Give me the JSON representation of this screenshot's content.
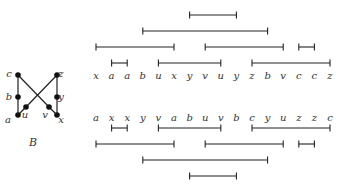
{
  "graph": {
    "caption": "B",
    "nodes": [
      {
        "id": "c",
        "x": 18,
        "y": 75,
        "lx": 9,
        "ly": 77
      },
      {
        "id": "b",
        "x": 18,
        "y": 97,
        "lx": 9,
        "ly": 100
      },
      {
        "id": "a",
        "x": 18,
        "y": 115,
        "lx": 8,
        "ly": 123
      },
      {
        "id": "u",
        "x": 26,
        "y": 107,
        "lx": 25,
        "ly": 118
      },
      {
        "id": "v",
        "x": 49,
        "y": 107,
        "lx": 45,
        "ly": 118
      },
      {
        "id": "z",
        "x": 57,
        "y": 75,
        "lx": 61,
        "ly": 77
      },
      {
        "id": "y",
        "x": 57,
        "y": 97,
        "lx": 61,
        "ly": 100
      },
      {
        "id": "x",
        "x": 57,
        "y": 115,
        "lx": 61,
        "ly": 123
      }
    ],
    "edges": [
      [
        "c",
        "b"
      ],
      [
        "b",
        "a"
      ],
      [
        "z",
        "y"
      ],
      [
        "y",
        "x"
      ],
      [
        "c",
        "v"
      ],
      [
        "v",
        "x"
      ],
      [
        "z",
        "u"
      ],
      [
        "u",
        "a"
      ]
    ]
  },
  "top": {
    "sequence": [
      "x",
      "a",
      "a",
      "b",
      "u",
      "x",
      "y",
      "v",
      "u",
      "y",
      "z",
      "b",
      "v",
      "c",
      "c",
      "z"
    ],
    "intervals": [
      {
        "row": 0,
        "from": 6,
        "to": 9
      },
      {
        "row": 1,
        "from": 3,
        "to": 11
      },
      {
        "row": 2,
        "from": 0,
        "to": 5
      },
      {
        "row": 2,
        "from": 7,
        "to": 12
      },
      {
        "row": 2,
        "from": 13,
        "to": 14
      },
      {
        "row": 3,
        "from": 1,
        "to": 2
      },
      {
        "row": 3,
        "from": 4,
        "to": 8
      },
      {
        "row": 3,
        "from": 10,
        "to": 15
      }
    ]
  },
  "bottom": {
    "sequence": [
      "a",
      "x",
      "x",
      "y",
      "v",
      "a",
      "b",
      "u",
      "v",
      "b",
      "c",
      "y",
      "u",
      "z",
      "z",
      "c"
    ],
    "intervals": [
      {
        "row": 0,
        "from": 1,
        "to": 2
      },
      {
        "row": 0,
        "from": 4,
        "to": 8
      },
      {
        "row": 0,
        "from": 10,
        "to": 15
      },
      {
        "row": 1,
        "from": 0,
        "to": 5
      },
      {
        "row": 1,
        "from": 7,
        "to": 12
      },
      {
        "row": 1,
        "from": 13,
        "to": 14
      },
      {
        "row": 2,
        "from": 3,
        "to": 11
      },
      {
        "row": 3,
        "from": 6,
        "to": 9
      }
    ]
  }
}
